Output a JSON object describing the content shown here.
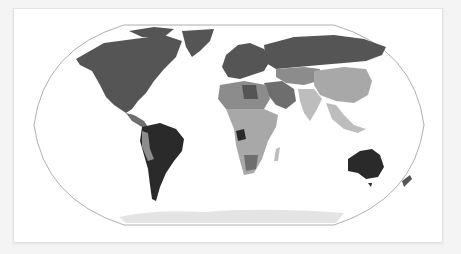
{
  "map": {
    "type": "choropleth",
    "projection": "robinson",
    "palette": "grayscale",
    "colors": {
      "background": "#f4f4f4",
      "card": "#ffffff",
      "ocean": "#ffffff",
      "outline": "#9a9a9a",
      "darkest": "#2a2a2a",
      "dark": "#555555",
      "mid_dark": "#6e6e6e",
      "mid": "#8c8c8c",
      "light": "#a8a8a8",
      "lighter": "#bdbdbd",
      "antarctica": "#e4e4e4"
    },
    "regions": [
      {
        "name": "North America",
        "shade": "dark"
      },
      {
        "name": "Greenland",
        "shade": "dark"
      },
      {
        "name": "Russia",
        "shade": "dark"
      },
      {
        "name": "Europe",
        "shade": "dark"
      },
      {
        "name": "Central Asia",
        "shade": "mid"
      },
      {
        "name": "China",
        "shade": "light"
      },
      {
        "name": "India",
        "shade": "lighter"
      },
      {
        "name": "Middle East",
        "shade": "mid_dark"
      },
      {
        "name": "North Africa",
        "shade": "mid"
      },
      {
        "name": "Sub-Saharan Africa",
        "shade": "light"
      },
      {
        "name": "South America",
        "shade": "darkest"
      },
      {
        "name": "Australia",
        "shade": "darkest"
      },
      {
        "name": "New Zealand",
        "shade": "dark"
      },
      {
        "name": "Southeast Asia",
        "shade": "lighter"
      },
      {
        "name": "Antarctica",
        "shade": "antarctica"
      }
    ]
  }
}
